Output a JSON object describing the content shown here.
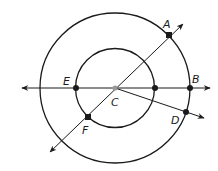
{
  "diagram": {
    "type": "concentric-circles-geometry",
    "center": {
      "label": "C",
      "x": 115,
      "y": 88
    },
    "circles": [
      {
        "name": "outer",
        "cx": 115,
        "cy": 88,
        "r": 75
      },
      {
        "name": "inner",
        "cx": 115,
        "cy": 88,
        "r": 40
      }
    ],
    "points": [
      {
        "label": "A",
        "x": 169,
        "y": 35
      },
      {
        "label": "B",
        "x": 190,
        "y": 88
      },
      {
        "label": "C",
        "x": 115,
        "y": 88
      },
      {
        "label": "D",
        "x": 186,
        "y": 112
      },
      {
        "label": "E",
        "x": 76,
        "y": 88
      },
      {
        "label": "F",
        "x": 88,
        "y": 117
      }
    ],
    "unlabeled_points": [
      {
        "x": 155,
        "y": 88
      }
    ],
    "lines": [
      {
        "name": "line-EB",
        "type": "line",
        "through": [
          "E",
          "B"
        ]
      },
      {
        "name": "line-FA",
        "type": "line",
        "through": [
          "F",
          "A"
        ]
      },
      {
        "name": "ray-CD",
        "type": "ray",
        "from": "C",
        "through": "D"
      }
    ],
    "labels": {
      "A": "A",
      "B": "B",
      "C": "C",
      "D": "D",
      "E": "E",
      "F": "F"
    },
    "colors": {
      "stroke": "#1a1a1a",
      "center_point": "#999999",
      "background": "#ffffff"
    }
  }
}
